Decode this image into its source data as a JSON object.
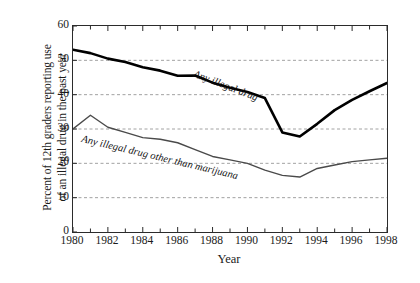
{
  "chart_data": {
    "type": "line",
    "title": "",
    "subtitle": "",
    "xlabel": "Year",
    "ylabel": "Percent of 12th graders reporting use of an illegal drug in the past year",
    "ylabel_line1": "Percent of 12th graders reporting use",
    "ylabel_line2": "of an illegal drug in the past year",
    "xlim": [
      1980,
      1998
    ],
    "ylim": [
      0,
      60
    ],
    "yticks": [
      0,
      10,
      20,
      30,
      40,
      50,
      60
    ],
    "ytick_labels": [
      "0",
      "10",
      "20",
      "30",
      "40",
      "50",
      "60"
    ],
    "xticks": [
      1980,
      1982,
      1984,
      1986,
      1988,
      1990,
      1992,
      1994,
      1996,
      1998
    ],
    "xtick_labels": [
      "1980",
      "1982",
      "1984",
      "1986",
      "1988",
      "1990",
      "1992",
      "1994",
      "1996",
      "1998"
    ],
    "x_minor_ticks": [
      1981,
      1983,
      1985,
      1987,
      1989,
      1991,
      1993,
      1995,
      1997
    ],
    "grid": "horizontal-dashed",
    "gridlines": [
      10,
      20,
      30,
      40,
      50
    ],
    "legend_position": "inline-annotation",
    "x": [
      1980,
      1981,
      1982,
      1983,
      1984,
      1985,
      1986,
      1987,
      1988,
      1989,
      1990,
      1991,
      1992,
      1993,
      1994,
      1995,
      1996,
      1997,
      1998
    ],
    "series": [
      {
        "name": "Any illegal drug",
        "label": "Any illegal drug",
        "color": "#000000",
        "linewidth": 2.6,
        "values": [
          53.1,
          52.1,
          50.5,
          49.5,
          48.0,
          47.0,
          45.5,
          45.6,
          43.5,
          42.0,
          40.8,
          39.0,
          29.0,
          27.8,
          31.5,
          35.5,
          38.5,
          41.0,
          43.4
        ]
      },
      {
        "name": "Any illegal drug other than marijuana",
        "label": "Any illegal drug other than marijuana",
        "color": "#4a4a4a",
        "linewidth": 1.4,
        "values": [
          30.0,
          34.0,
          30.5,
          29.0,
          27.5,
          27.0,
          26.0,
          24.0,
          22.0,
          21.0,
          20.0,
          18.0,
          16.5,
          16.0,
          18.5,
          19.5,
          20.5,
          21.0,
          21.5
        ]
      }
    ],
    "annotations": [
      {
        "name": "any-illegal-drug",
        "text": "Any illegal drug",
        "rotation": 21
      },
      {
        "name": "other-than-marijuana",
        "text": "Any illegal drug other than marijuana",
        "rotation": 13.5
      }
    ]
  }
}
